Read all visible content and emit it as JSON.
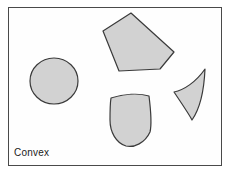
{
  "figure": {
    "caption": "Convex",
    "background_color": "#fefefe",
    "frame_color": "#4a4a4a",
    "shape_fill": "#d2d2d2",
    "shape_stroke": "#3a3a3a",
    "shape_count": 4,
    "shapes": [
      {
        "id": "circle",
        "name": "circle-shape",
        "kind": "ellipse",
        "label": "circle",
        "cx": 54,
        "cy": 81,
        "rx": 24,
        "ry": 23
      },
      {
        "id": "pentagon",
        "name": "pentagon-shape",
        "kind": "polygon",
        "label": "pentagon",
        "points": "131,13 174,52 160,69 119,71 103,31"
      },
      {
        "id": "fan",
        "name": "curved-triangle-shape",
        "kind": "path",
        "label": "curved triangle",
        "d": "M 205,69 C 196,82 184,90 174,92 C 182,104 189,114 192,120 C 199,110 204,92 205,69 Z"
      },
      {
        "id": "dome",
        "name": "dome-shape",
        "kind": "path",
        "label": "dome",
        "d": "M 111,98 C 124,94 139,93 149,96 C 151,112 152,124 150,132 C 145,143 134,148 126,146 C 116,143 110,132 110,120 C 110,112 110,104 111,98 Z"
      }
    ]
  }
}
